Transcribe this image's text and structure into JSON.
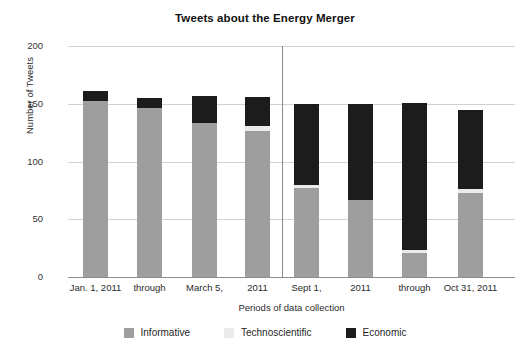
{
  "chart_data": {
    "type": "bar",
    "title": "Tweets about the Energy Merger",
    "xlabel": "Periods of data collection",
    "ylabel": "Number of Tweets",
    "ylim": [
      0,
      200
    ],
    "yticks": [
      0,
      50,
      100,
      150,
      200
    ],
    "grid": true,
    "stacked": true,
    "legend_position": "bottom",
    "categories": [
      "Jan. 1, 2011",
      "through",
      "March 5,",
      "2011",
      "Sept 1,",
      "2011",
      "through",
      "Oct 31, 2011"
    ],
    "series": [
      {
        "name": "Informative",
        "color": "#9e9e9e",
        "values": [
          152,
          146,
          133,
          126,
          77,
          67,
          21,
          73
        ]
      },
      {
        "name": "Technoscientific",
        "color": "#ebebeb",
        "values": [
          0,
          0,
          0,
          5,
          3,
          0,
          2,
          3
        ]
      },
      {
        "name": "Economic",
        "color": "#1c1c1c",
        "values": [
          9,
          9,
          24,
          25,
          70,
          83,
          128,
          69
        ]
      }
    ],
    "totals": [
      161,
      155,
      157,
      156,
      150,
      150,
      151,
      145
    ],
    "group_divider_after_category_index": 3
  },
  "legend": {
    "items": [
      {
        "label": "Informative",
        "color": "#9e9e9e"
      },
      {
        "label": "Technoscientific",
        "color": "#ebebeb"
      },
      {
        "label": "Economic",
        "color": "#1c1c1c"
      }
    ]
  }
}
